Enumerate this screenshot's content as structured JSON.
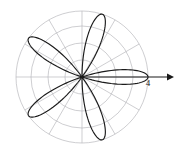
{
  "figure": {
    "title": "",
    "background_color": "#ffffff",
    "width": 176,
    "height": 150
  },
  "axis": {
    "label_text": "4",
    "label_x": 148,
    "label_y": 86,
    "arrow_color": "#1a1a1a",
    "arrow_start_x": 82,
    "arrow_end_x": 170,
    "arrow_y": 77
  },
  "grid": {
    "color": "#b9b9bd",
    "circle_count": 4,
    "circle_radii_px": [
      17,
      34,
      51,
      66
    ],
    "spoke_count": 12,
    "spoke_step_degrees": 30,
    "center_x": 82,
    "center_y": 77,
    "grid_on": true
  },
  "chart_data": {
    "type": "line",
    "plot_kind": "polar-rose",
    "title": "",
    "subtitle": "",
    "xlabel": "",
    "ylabel": "",
    "equation": "r = 4 cos(5θ)",
    "amplitude": 4,
    "petal_count": 5,
    "petal_angles_degrees": [
      0,
      72,
      144,
      216,
      288
    ],
    "r_max": 4,
    "rlim": [
      0,
      4
    ],
    "radial_tick_values": [
      1,
      2,
      3,
      4
    ],
    "angular_tick_degrees": [
      0,
      30,
      60,
      90,
      120,
      150,
      180,
      210,
      240,
      270,
      300,
      330
    ],
    "curve_color": "#1b1b1b",
    "grid": true,
    "legend": false,
    "legend_entries": [],
    "annotations": [
      {
        "text": "4",
        "r": 4,
        "theta_degrees": 0,
        "note": "radial scale marker at tip of horizontal petal"
      }
    ],
    "series": [
      {
        "name": "r = 4 cos(5θ)",
        "theta_degrees": [
          0,
          4,
          8,
          12,
          16,
          20,
          24,
          28,
          32,
          36,
          40,
          44,
          48,
          52,
          56,
          60,
          64,
          68,
          72,
          76,
          80,
          84,
          88,
          92,
          96,
          100,
          104,
          108,
          112,
          116,
          120,
          124,
          128,
          132,
          136,
          140,
          144,
          148,
          152,
          156,
          160,
          164,
          168,
          172,
          176,
          180,
          184,
          188,
          192,
          196,
          200,
          204,
          208,
          212,
          216,
          220,
          224,
          228,
          232,
          236,
          240,
          244,
          248,
          252,
          256,
          260,
          264,
          268,
          272,
          276,
          280,
          284,
          288,
          292,
          296,
          300,
          304,
          308,
          312,
          316,
          320,
          324,
          328,
          332,
          336,
          340,
          344,
          348,
          352,
          356,
          360
        ],
        "r_values": [
          4.0,
          3.76,
          3.06,
          2.0,
          0.7,
          -0.7,
          -2.0,
          -3.06,
          -3.76,
          -4.0,
          -3.76,
          -3.06,
          -2.0,
          -0.7,
          0.7,
          2.0,
          3.06,
          3.76,
          4.0,
          3.76,
          3.06,
          2.0,
          0.7,
          -0.7,
          -2.0,
          -3.06,
          -3.76,
          -4.0,
          -3.76,
          -3.06,
          -2.0,
          -0.7,
          0.7,
          2.0,
          3.06,
          3.76,
          4.0,
          3.76,
          3.06,
          2.0,
          0.7,
          -0.7,
          -2.0,
          -3.06,
          -3.76,
          -4.0,
          -3.76,
          -3.06,
          -2.0,
          -0.7,
          0.7,
          2.0,
          3.06,
          3.76,
          4.0,
          3.76,
          3.06,
          2.0,
          0.7,
          -0.7,
          -2.0,
          -3.06,
          -3.76,
          -4.0,
          -3.76,
          -3.06,
          -2.0,
          -0.7,
          0.7,
          2.0,
          3.06,
          3.76,
          4.0,
          3.76,
          3.06,
          2.0,
          0.7,
          -0.7,
          -2.0,
          -3.06,
          -3.76,
          -4.0,
          -3.76,
          -3.06,
          -2.0,
          -0.7,
          0.7,
          2.0,
          3.06,
          4.0
        ]
      }
    ]
  }
}
